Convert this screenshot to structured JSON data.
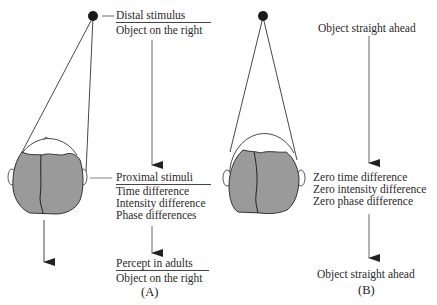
{
  "panel_a": {
    "label": "(A)",
    "distal_heading": "Distal stimulus",
    "distal_value": "Object on the right",
    "proximal_heading": "Proximal stimuli",
    "proximal_items": [
      "Time difference",
      "Intensity difference",
      "Phase differences"
    ],
    "percept_heading": "Percept in adults",
    "percept_value": "Object on the right"
  },
  "panel_b": {
    "label": "(B)",
    "top_text": "Object straight ahead",
    "proximal_items": [
      "Zero time difference",
      "Zero intensity difference",
      "Zero phase difference"
    ],
    "bottom_text": "Object straight ahead"
  },
  "colors": {
    "head_fill": "#9a9a9a",
    "line": "#333333",
    "dot": "#1a1a1a"
  }
}
